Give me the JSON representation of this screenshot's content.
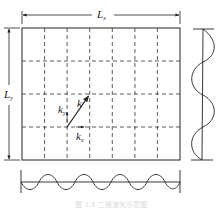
{
  "diagram": {
    "type": "2D wave vector in rectangular domain",
    "labels": {
      "Lx": {
        "base": "L",
        "sub": "x"
      },
      "Ly": {
        "base": "L",
        "sub": "y"
      },
      "k": {
        "base": "k",
        "sub": ""
      },
      "kx": {
        "base": "k",
        "sub": "x"
      },
      "ky": {
        "base": "k",
        "sub": "y"
      }
    },
    "grid": {
      "columns": 7,
      "rows": 4,
      "line_style": "dashed"
    },
    "bottom_wave": {
      "cycles": 3.5,
      "orientation": "horizontal"
    },
    "right_wave": {
      "cycles": 2.0,
      "orientation": "vertical"
    },
    "caption": "图 1.1  二维波矢示意图"
  },
  "colors": {
    "line": "#222222",
    "background": "#ffffff",
    "caption": "#d8d8d8"
  }
}
